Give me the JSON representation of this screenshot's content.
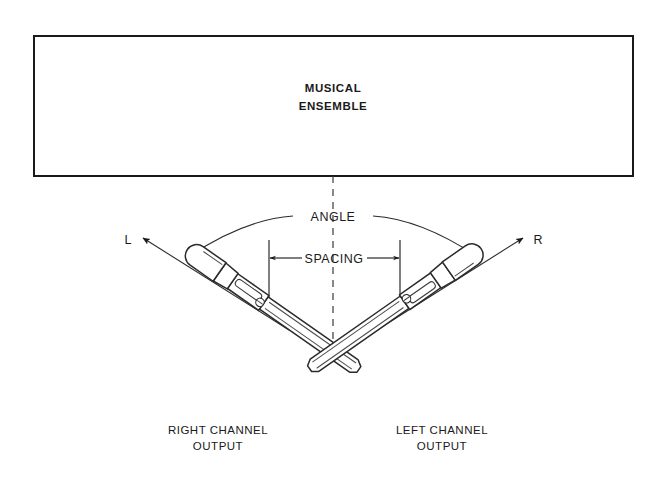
{
  "source_box": {
    "label_line1": "MUSICAL",
    "label_line2": "ENSEMBLE"
  },
  "dimensions": {
    "angle_label": "ANGLE",
    "spacing_label": "SPACING"
  },
  "axis_labels": {
    "left": "L",
    "right": "R"
  },
  "outputs": {
    "right": {
      "line1": "RIGHT CHANNEL",
      "line2": "OUTPUT"
    },
    "left": {
      "line1": "LEFT CHANNEL",
      "line2": "OUTPUT"
    }
  },
  "colors": {
    "ink": "#1a1a1a",
    "line": "#2b2b2b",
    "dash": "#3a3a3a",
    "paper": "#ffffff"
  },
  "icons": {
    "centerline": "dashed-centerline-icon",
    "left_mic": "microphone-icon",
    "right_mic": "microphone-icon",
    "angle_arc": "arc-dimension-icon",
    "spacing_dim": "linear-dimension-icon"
  }
}
